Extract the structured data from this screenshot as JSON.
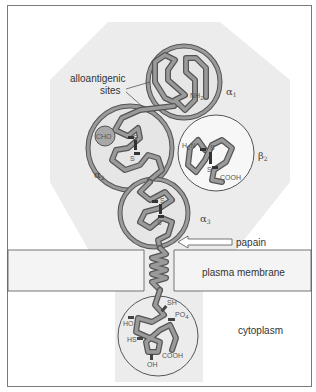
{
  "diagram": {
    "domains": {
      "alpha1": {
        "symbol": "α",
        "sub": "1"
      },
      "alpha2": {
        "symbol": "α",
        "sub": "2"
      },
      "alpha3": {
        "symbol": "α",
        "sub": "3"
      },
      "beta2": {
        "symbol": "β",
        "sub": "2"
      }
    },
    "labels": {
      "alloantigenic_line1": "alloantigenic",
      "alloantigenic_line2": "sites",
      "papain": "papain",
      "plasma_membrane": "plasma membrane",
      "cytoplasm": "cytoplasm",
      "cho": "CHO",
      "nh2": "NH",
      "nh2_sub": "2",
      "h2n": "H",
      "h2n_sub": "2",
      "h2n_tail": "N",
      "s": "S",
      "cooh": "COOH",
      "sh": "SH",
      "po4": "PO",
      "po4_sub": "4",
      "ho": "HO",
      "hs": "HS",
      "oh": "OH"
    },
    "colors": {
      "chain_fill": "#9a9a9a",
      "chain_outline": "#555555",
      "octagon_bg": "#ececec",
      "domain_bg": "#e6e6e6",
      "beta_bg": "#f7f7f7",
      "membrane_bg": "#f3f3f3",
      "disulfide": "#333333",
      "cho_fill": "#a8a8a8"
    }
  }
}
